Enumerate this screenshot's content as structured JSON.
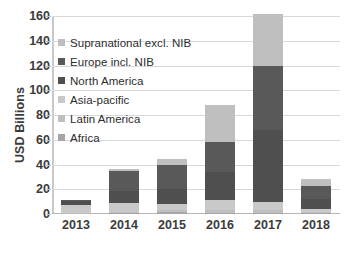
{
  "chart_data": {
    "type": "bar",
    "title": "",
    "subtitle": "",
    "xlabel": "",
    "ylabel": "USD Billions",
    "categories": [
      "2013",
      "2014",
      "2015",
      "2016",
      "2017",
      "2018"
    ],
    "ylim": [
      0,
      160
    ],
    "yticks": [
      0,
      20,
      40,
      60,
      80,
      100,
      120,
      140,
      160
    ],
    "grid": true,
    "stacked": true,
    "legend_position": "inside-upper-left",
    "series": [
      {
        "name": "Africa",
        "color": "#a6a6a6",
        "values": [
          0,
          0.5,
          1.5,
          1.0,
          1.0,
          0.5
        ]
      },
      {
        "name": "Latin America",
        "color": "#bfbfbf",
        "values": [
          1.0,
          1.5,
          1.5,
          2.0,
          2.0,
          1.0
        ]
      },
      {
        "name": "Asia-pacific",
        "color": "#c9c9c9",
        "values": [
          6.5,
          7.0,
          5.0,
          8.0,
          7.0,
          2.5
        ]
      },
      {
        "name": "North America",
        "color": "#4f4f4f",
        "values": [
          3.0,
          10.0,
          12.0,
          23.0,
          58.0,
          8.0
        ]
      },
      {
        "name": "Europe incl. NIB",
        "color": "#595959",
        "values": [
          0.5,
          16.0,
          20.0,
          24.0,
          52.0,
          11.0
        ]
      },
      {
        "name": "Supranational excl. NIB",
        "color": "#bfbfbf",
        "values": [
          0,
          1.0,
          4.5,
          30.0,
          42.0,
          5.0
        ]
      }
    ],
    "totals": [
      11,
      36,
      44.5,
      88,
      162,
      28
    ]
  },
  "legend": {
    "items": [
      {
        "label": "Supranational excl. NIB",
        "color": "#bfbfbf"
      },
      {
        "label": "Europe incl. NIB",
        "color": "#595959"
      },
      {
        "label": "North America",
        "color": "#4f4f4f"
      },
      {
        "label": "Asia-pacific",
        "color": "#c9c9c9"
      },
      {
        "label": "Latin America",
        "color": "#bfbfbf"
      },
      {
        "label": "Africa",
        "color": "#a6a6a6"
      }
    ]
  },
  "colors": {
    "gridline": "#d9d9d9",
    "axis": "#b5b5b5",
    "text": "#3b3b3b",
    "background": "#ffffff"
  }
}
